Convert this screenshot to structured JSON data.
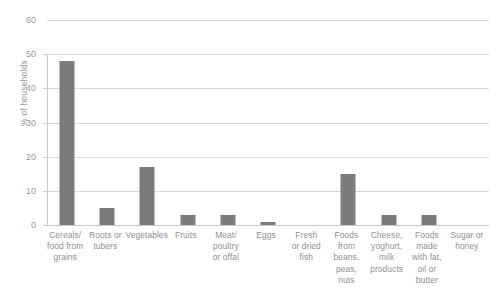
{
  "chart_data": {
    "type": "bar",
    "title": "",
    "xlabel": "",
    "ylabel": "% of households",
    "ylim": [
      0,
      60
    ],
    "yticks": [
      0,
      10,
      20,
      30,
      40,
      50,
      60
    ],
    "grid": true,
    "legend": "none",
    "bar_color": "#7c7c7c",
    "grid_color": "#d9d9d9",
    "categories": [
      "Cereals/ food from grains",
      "Roots or tubers",
      "Vegetables",
      "Fruits",
      "Meat/ poultry or offal",
      "Eggs",
      "Fresh or dried fish",
      "Foods from beans, peas, nuts",
      "Cheese, yoghurt, milk products",
      "Foods made with fat, oil or butter",
      "Sugar or honey"
    ],
    "category_lines": [
      [
        "Cereals/",
        "food from",
        "grains"
      ],
      [
        "Roots or",
        "tubers"
      ],
      [
        "Vegetables"
      ],
      [
        "Fruits"
      ],
      [
        "Meat/",
        "poultry",
        "or offal"
      ],
      [
        "Eggs"
      ],
      [
        "Fresh",
        "or dried",
        "fish"
      ],
      [
        "Foods",
        "from",
        "beans,",
        "peas,",
        "nuts"
      ],
      [
        "Cheese,",
        "yoghurt,",
        "milk",
        "products"
      ],
      [
        "Foods",
        "made",
        "with fat,",
        "oil or",
        "butter"
      ],
      [
        "Sugar or",
        "honey"
      ]
    ],
    "values": [
      48,
      5,
      17,
      3,
      3,
      1,
      0,
      15,
      3,
      3,
      0
    ]
  },
  "header": {
    "title_remnant": ""
  }
}
